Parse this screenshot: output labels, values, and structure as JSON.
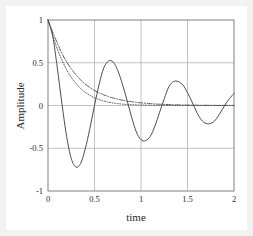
{
  "figure": {
    "background": "#ffffff",
    "outer_border_color": "#f2f2f2",
    "frame_color": "#808080"
  },
  "chart_data": {
    "type": "line",
    "title": "",
    "subtitle": "",
    "xlabel": "time",
    "ylabel": "Amplitude",
    "xlim": [
      0,
      2
    ],
    "ylim": [
      -1,
      1
    ],
    "xticks": [
      0,
      0.5,
      1,
      1.5,
      2
    ],
    "xticklabels": [
      "0",
      "0.5",
      "1",
      "1.5",
      "2"
    ],
    "yticks": [
      -1,
      -0.5,
      0,
      0.5,
      1
    ],
    "yticklabels": [
      "-1",
      "-0.5",
      "0",
      "0.5",
      "1"
    ],
    "grid": true,
    "grid_color": "#9a9a9a",
    "legend": null,
    "legend_position": "none",
    "annotations": [],
    "series": [
      {
        "name": "underdamped",
        "style": "solid",
        "color": "#4d4d4d",
        "x": [
          0,
          0.05,
          0.1,
          0.15,
          0.2,
          0.25,
          0.3,
          0.35,
          0.4,
          0.45,
          0.5,
          0.55,
          0.6,
          0.65,
          0.7,
          0.75,
          0.8,
          0.85,
          0.9,
          0.95,
          1.0,
          1.05,
          1.1,
          1.15,
          1.2,
          1.25,
          1.3,
          1.35,
          1.4,
          1.45,
          1.5,
          1.55,
          1.6,
          1.65,
          1.7,
          1.75,
          1.8,
          1.85,
          1.9,
          1.95,
          2.0
        ],
        "y": [
          1.0,
          0.82,
          0.44,
          0.02,
          -0.36,
          -0.62,
          -0.72,
          -0.68,
          -0.51,
          -0.27,
          0.0,
          0.25,
          0.44,
          0.52,
          0.51,
          0.41,
          0.25,
          0.06,
          -0.14,
          -0.31,
          -0.4,
          -0.41,
          -0.36,
          -0.24,
          -0.08,
          0.08,
          0.22,
          0.28,
          0.28,
          0.24,
          0.15,
          0.04,
          -0.08,
          -0.17,
          -0.21,
          -0.21,
          -0.17,
          -0.09,
          0.0,
          0.08,
          0.14
        ]
      },
      {
        "name": "critically-damped",
        "style": "dashdot",
        "color": "#4d4d4d",
        "x": [
          0,
          0.05,
          0.1,
          0.15,
          0.2,
          0.25,
          0.3,
          0.35,
          0.4,
          0.45,
          0.5,
          0.55,
          0.6,
          0.65,
          0.7,
          0.75,
          0.8,
          0.85,
          0.9,
          0.95,
          1.0,
          1.1,
          1.2,
          1.4,
          1.6,
          1.8,
          2.0
        ],
        "y": [
          1.0,
          0.86,
          0.73,
          0.61,
          0.51,
          0.43,
          0.36,
          0.3,
          0.25,
          0.21,
          0.175,
          0.148,
          0.125,
          0.105,
          0.088,
          0.074,
          0.062,
          0.052,
          0.044,
          0.037,
          0.031,
          0.022,
          0.015,
          0.007,
          0.003,
          0.0015,
          0.001
        ]
      },
      {
        "name": "overdamped",
        "style": "dotted",
        "color": "#4d4d4d",
        "x": [
          0,
          0.05,
          0.1,
          0.15,
          0.2,
          0.25,
          0.3,
          0.35,
          0.4,
          0.45,
          0.5,
          0.55,
          0.6,
          0.65,
          0.7,
          0.75,
          0.8,
          0.9,
          1.0,
          1.2,
          1.5,
          1.75,
          2.0
        ],
        "y": [
          1.0,
          0.82,
          0.66,
          0.53,
          0.42,
          0.33,
          0.26,
          0.2,
          0.155,
          0.12,
          0.09,
          0.069,
          0.052,
          0.039,
          0.029,
          0.022,
          0.016,
          0.009,
          0.005,
          0.0015,
          0.0004,
          0.0002,
          0.0001
        ]
      }
    ]
  }
}
